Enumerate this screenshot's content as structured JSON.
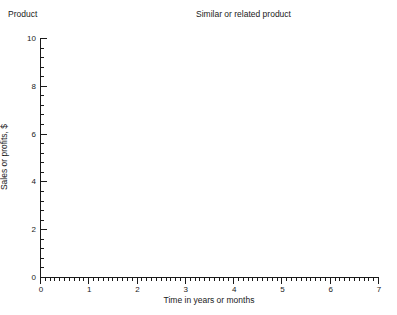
{
  "header": {
    "product_label": "Product",
    "product_blank_value": "",
    "similar_label": "Similar or related product",
    "similar_blank_value": ""
  },
  "chart_data": {
    "type": "line",
    "title": "",
    "xlabel": "Time in years or months",
    "ylabel": "Sales or profits, $",
    "xlim": [
      0,
      7
    ],
    "ylim": [
      0,
      10
    ],
    "x_major_ticks": [
      0,
      1,
      2,
      3,
      4,
      5,
      6,
      7
    ],
    "x_tick_labels": [
      "0",
      "1",
      "2",
      "3",
      "4",
      "5",
      "6",
      "7"
    ],
    "x_minor_step": 0.1,
    "y_major_ticks": [
      0,
      2,
      4,
      6,
      8,
      10
    ],
    "y_tick_labels": [
      "0",
      "2",
      "4",
      "6",
      "8",
      "10"
    ],
    "y_minor_step": 0.4,
    "grid": false,
    "legend": null,
    "series": [],
    "values": [],
    "annotations": [],
    "axis_color": "#1a1a1a",
    "plot_background": "#ffffff"
  }
}
